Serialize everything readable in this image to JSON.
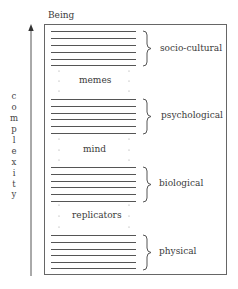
{
  "title": "Being",
  "axis": {
    "label": "complexity",
    "letters": [
      "c",
      "o",
      "m",
      "p",
      "l",
      "e",
      "x",
      "i",
      "t",
      "y"
    ]
  },
  "levels": [
    {
      "name": "socio-cultural",
      "line_count": 6
    },
    {
      "name": "psychological",
      "line_count": 6
    },
    {
      "name": "biological",
      "line_count": 6
    },
    {
      "name": "physical",
      "line_count": 6
    }
  ],
  "transitions": [
    {
      "label": "memes"
    },
    {
      "label": "mind"
    },
    {
      "label": "replicators"
    }
  ],
  "colors": {
    "line": "#555555",
    "box": "#666666",
    "text": "#3a3a3a"
  }
}
